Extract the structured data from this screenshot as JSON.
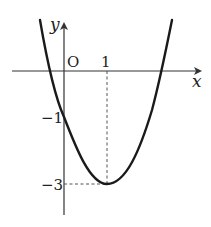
{
  "figure": {
    "type": "function-graph",
    "function": "y = 2x^2 - 4x - 1",
    "curve": "parabola",
    "opens": "up",
    "vertex": {
      "x": 1,
      "y": -3
    },
    "y_intercept": -1,
    "colors": {
      "curve": "#1a1a1a",
      "axis": "#333333",
      "dashed": "#555555",
      "background": "#ffffff"
    }
  },
  "labels": {
    "x_axis": "x",
    "y_axis": "y",
    "origin": "O",
    "x_tick_1": "1",
    "y_tick_minus1": "−1",
    "y_tick_minus3": "−3"
  }
}
